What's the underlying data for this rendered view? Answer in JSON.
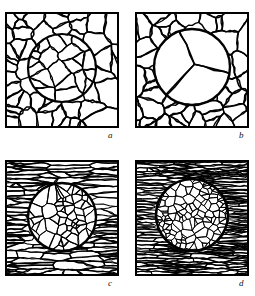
{
  "figure": {
    "type": "micrograph-schematic-grid",
    "background_color": "#ffffff",
    "line_color": "#000000",
    "rows": 2,
    "columns": 2,
    "panel_width": 114,
    "panel_height": 116,
    "frame_stroke_width": 2.0
  },
  "panels": [
    {
      "id": "a",
      "label": "a",
      "matrix_structure": "equiaxed-coarse",
      "matrix_grain_count": 54,
      "matrix_elongation": 1.0,
      "circle": {
        "center_x": 57,
        "center_y": 56,
        "radius": 34,
        "stroke_width": 2.2
      },
      "inclusion_structure": "equiaxed-medium",
      "inclusion_grain_count": 22,
      "inclusion_elongation": 1.0,
      "seed": 101
    },
    {
      "id": "b",
      "label": "b",
      "matrix_structure": "equiaxed-coarse",
      "matrix_grain_count": 58,
      "matrix_elongation": 1.0,
      "circle": {
        "center_x": 57,
        "center_y": 55,
        "radius": 38,
        "stroke_width": 2.4
      },
      "inclusion_structure": "coarse-few-grains",
      "inclusion_grain_count": 3,
      "inclusion_elongation": 1.0,
      "seed": 202
    },
    {
      "id": "c",
      "label": "c",
      "matrix_structure": "banded-elongated",
      "matrix_grain_count": 150,
      "matrix_elongation": 6.5,
      "circle": {
        "center_x": 57,
        "center_y": 57,
        "radius": 34,
        "stroke_width": 2.4
      },
      "inclusion_structure": "equiaxed-fine",
      "inclusion_grain_count": 62,
      "inclusion_elongation": 1.0,
      "seed": 303
    },
    {
      "id": "d",
      "label": "d",
      "matrix_structure": "banded-elongated-fine",
      "matrix_grain_count": 280,
      "matrix_elongation": 9.0,
      "circle": {
        "center_x": 57,
        "center_y": 55,
        "radius": 36,
        "stroke_width": 2.6
      },
      "inclusion_structure": "equiaxed-very-fine",
      "inclusion_grain_count": 130,
      "inclusion_elongation": 1.0,
      "seed": 404
    }
  ],
  "labels": {
    "a": "a",
    "b": "b",
    "c": "c",
    "d": "d"
  }
}
